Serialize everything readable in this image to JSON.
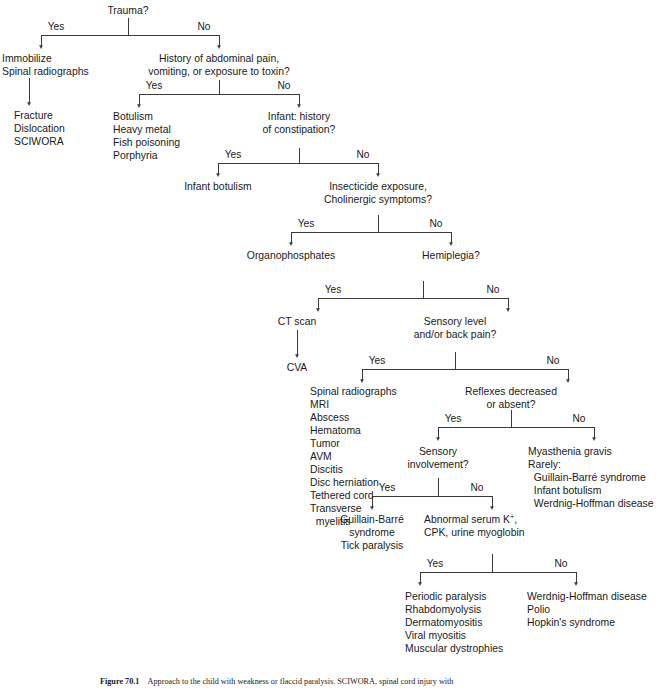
{
  "figure": {
    "caption_label": "Figure 70.1",
    "caption_text": "Approach to the child with weakness or flaccid paralysis. SCIWORA, spinal cord injury with",
    "ink_color": "#1a1a1a",
    "line_color": "#3b3b3b",
    "background": "#ffffff"
  },
  "branch_labels": {
    "yes": "Yes",
    "no": "No"
  },
  "questions": {
    "trauma": "Trauma?",
    "abdominal": [
      "History of abdominal pain,",
      "vomiting, or exposure to toxin?"
    ],
    "infant_constipation": [
      "Infant: history",
      "of constipation?"
    ],
    "insecticide": [
      "Insecticide exposure,",
      "Cholinergic symptoms?"
    ],
    "hemiplegia": "Hemiplegia?",
    "sensory_level": [
      "Sensory level",
      "and/or back pain?"
    ],
    "reflexes": [
      "Reflexes decreased",
      "or absent?"
    ],
    "sensory_involvement": [
      "Sensory",
      "involvement?"
    ],
    "abnormal_serum": [
      "Abnormal serum K",
      "CPK, urine myoglobin"
    ],
    "abnormal_serum_sup": "+",
    "abnormal_serum_tail": ","
  },
  "outcomes": {
    "immobilize": [
      "Immobilize",
      "Spinal radiographs"
    ],
    "fracture": [
      "Fracture",
      "Dislocation",
      "SCIWORA"
    ],
    "botulism_group": [
      "Botulism",
      "Heavy metal",
      "Fish poisoning",
      "Porphyria"
    ],
    "infant_botulism": [
      "Infant botulism"
    ],
    "organophosphates": [
      "Organophosphates"
    ],
    "ct_scan": [
      "CT scan"
    ],
    "cva": [
      "CVA"
    ],
    "spinal_workup": [
      "Spinal radiographs",
      "MRI",
      "Abscess",
      "Hematoma",
      "Tumor",
      "AVM",
      "Discitis",
      "Disc herniation",
      "Tethered cord",
      "Transverse",
      "  myelitis"
    ],
    "myasthenia": [
      "Myasthenia gravis",
      "Rarely:",
      "  Guillain-Barré syndrome",
      "  Infant botulism",
      "  Werdnig-Hoffman disease"
    ],
    "guillain_barre": [
      "Guillain-Barré",
      "syndrome",
      "Tick paralysis"
    ],
    "myopathies": [
      "Periodic paralysis",
      "Rhabdomyolysis",
      "Dermatomyositis",
      "Viral myositis",
      "Muscular dystrophies"
    ],
    "motor_neuron": [
      "Werdnig-Hoffman disease",
      "Polio",
      "Hopkin's syndrome"
    ]
  }
}
